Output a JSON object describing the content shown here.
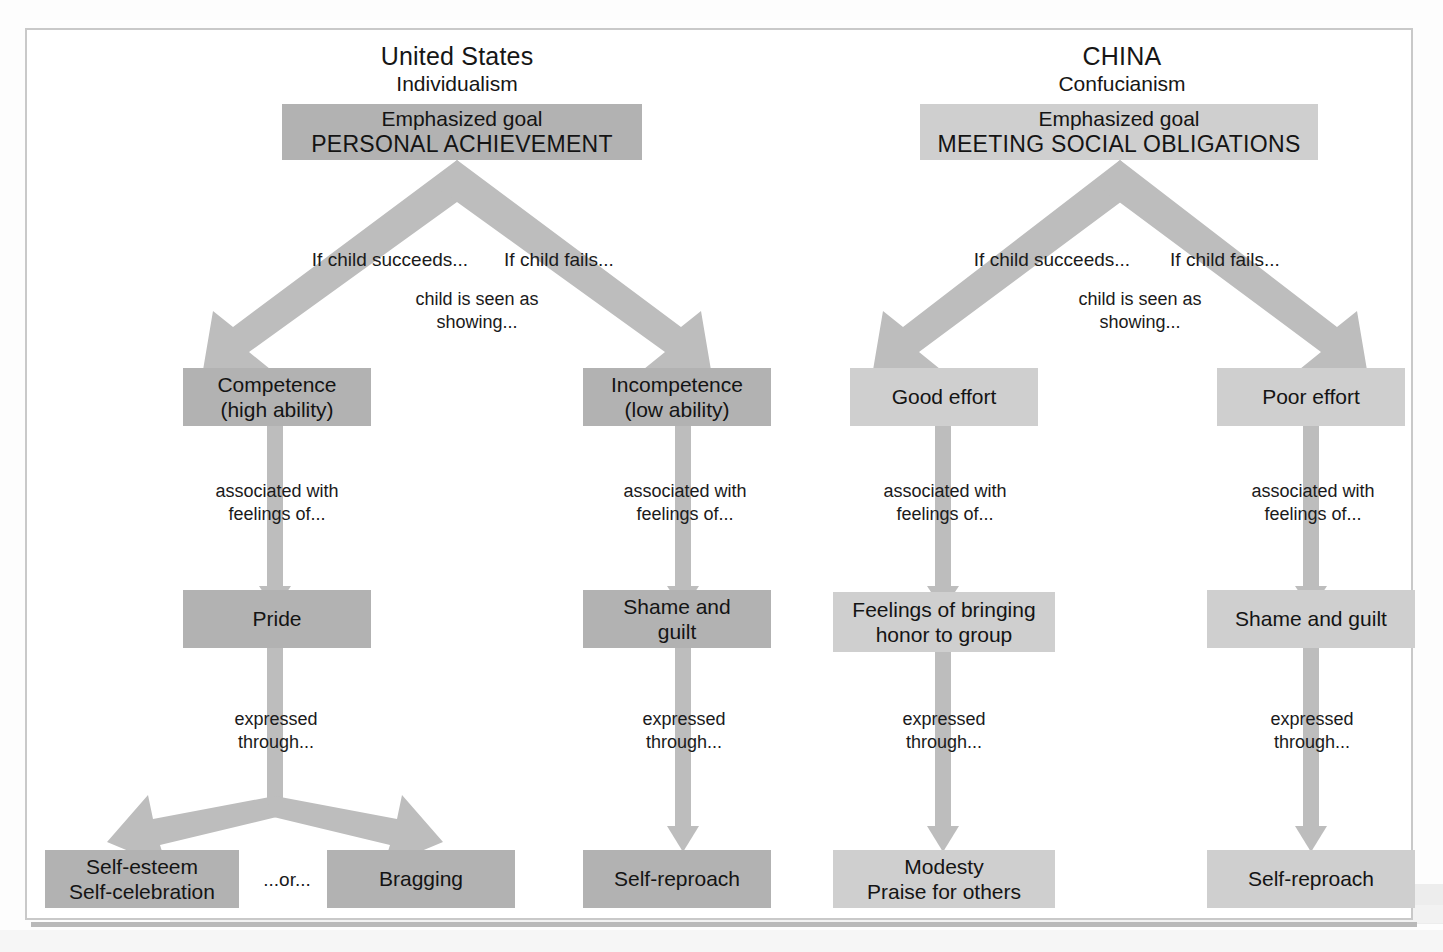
{
  "figure": {
    "type": "flowchart"
  },
  "columns": [
    {
      "id": "united-states",
      "country": "United States",
      "philosophy": "Individualism",
      "goal_label": "Emphasized goal",
      "goal_value": "PERSONAL ACHIEVEMENT",
      "branch_success": "If child succeeds...",
      "branch_fail": "If child fails...",
      "branch_common": "child is seen as\nshowing...",
      "branch_common_l1": "child is seen as",
      "branch_common_l2": "showing...",
      "success": {
        "attribution_l1": "Competence",
        "attribution_l2": "(high ability)",
        "link_feelings_l1": "associated with",
        "link_feelings_l2": "feelings of...",
        "emotion": "Pride",
        "link_expressed_l1": "expressed",
        "link_expressed_l2": "through...",
        "outcome_a_l1": "Self-esteem",
        "outcome_a_l2": "Self-celebration",
        "outcome_connector": "...or...",
        "outcome_b": "Bragging"
      },
      "failure": {
        "attribution_l1": "Incompetence",
        "attribution_l2": "(low ability)",
        "link_feelings_l1": "associated with",
        "link_feelings_l2": "feelings of...",
        "emotion_l1": "Shame and",
        "emotion_l2": "guilt",
        "link_expressed_l1": "expressed",
        "link_expressed_l2": "through...",
        "outcome": "Self-reproach"
      }
    },
    {
      "id": "china",
      "country": "CHINA",
      "philosophy": "Confucianism",
      "goal_label": "Emphasized goal",
      "goal_value": "MEETING SOCIAL OBLIGATIONS",
      "branch_success": "If child succeeds...",
      "branch_fail": "If child fails...",
      "branch_common_l1": "child is seen as",
      "branch_common_l2": "showing...",
      "success": {
        "attribution": "Good effort",
        "link_feelings_l1": "associated with",
        "link_feelings_l2": "feelings of...",
        "emotion_l1": "Feelings of bringing",
        "emotion_l2": "honor to group",
        "link_expressed_l1": "expressed",
        "link_expressed_l2": "through...",
        "outcome_l1": "Modesty",
        "outcome_l2": "Praise for others"
      },
      "failure": {
        "attribution": "Poor effort",
        "link_feelings_l1": "associated with",
        "link_feelings_l2": "feelings of...",
        "emotion": "Shame and guilt",
        "link_expressed_l1": "expressed",
        "link_expressed_l2": "through...",
        "outcome": "Self-reproach"
      }
    }
  ],
  "colors": {
    "us_box": "#b2b2b2",
    "cn_box": "#cfcfcf",
    "arrow": "#bdbdbd",
    "text": "#141414",
    "plate_border": "#c9c9c9",
    "page_background": "#ffffff"
  }
}
